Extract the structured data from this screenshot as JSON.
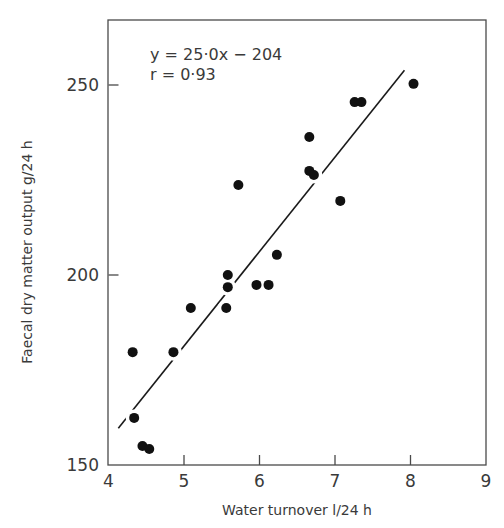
{
  "chart_data": {
    "type": "scatter",
    "title": "",
    "xlabel": "Water turnover  l/24 h",
    "ylabel": "Faecal  dry matter output g/24 h",
    "xlim": [
      4,
      9
    ],
    "ylim": [
      150,
      270
    ],
    "x_ticks": [
      4,
      5,
      6,
      7,
      8,
      9
    ],
    "y_ticks": [
      150,
      200,
      250
    ],
    "grid": false,
    "legend": null,
    "annotations": [
      "y = 25·0x − 204",
      "r = 0·93"
    ],
    "series": [
      {
        "name": "observations",
        "marker": "filled-circle",
        "points": [
          {
            "x": 4.32,
            "y": 179.7
          },
          {
            "x": 4.34,
            "y": 162.4
          },
          {
            "x": 4.45,
            "y": 155.0
          },
          {
            "x": 4.54,
            "y": 154.2
          },
          {
            "x": 4.86,
            "y": 179.7
          },
          {
            "x": 5.09,
            "y": 191.3
          },
          {
            "x": 5.56,
            "y": 191.3
          },
          {
            "x": 5.58,
            "y": 196.8
          },
          {
            "x": 5.58,
            "y": 200.0
          },
          {
            "x": 5.72,
            "y": 223.7
          },
          {
            "x": 5.96,
            "y": 197.4
          },
          {
            "x": 6.12,
            "y": 197.4
          },
          {
            "x": 6.23,
            "y": 205.3
          },
          {
            "x": 6.66,
            "y": 236.3
          },
          {
            "x": 6.66,
            "y": 227.4
          },
          {
            "x": 6.72,
            "y": 226.3
          },
          {
            "x": 7.07,
            "y": 219.5
          },
          {
            "x": 7.26,
            "y": 245.5
          },
          {
            "x": 7.35,
            "y": 245.5
          },
          {
            "x": 8.04,
            "y": 250.3
          }
        ]
      }
    ],
    "regression_line": {
      "label": "y = 25·0x − 204",
      "r": 0.93,
      "drawn_from": {
        "x": 4.13,
        "y": 159.7
      },
      "drawn_to": {
        "x": 7.92,
        "y": 253.9
      }
    }
  },
  "axes": {
    "x_tick_labels": [
      "4",
      "5",
      "6",
      "7",
      "8",
      "9"
    ],
    "y_tick_labels": [
      "150",
      "200",
      "250"
    ],
    "xlabel": "Water turnover  l/24 h",
    "ylabel": "Faecal  dry matter output g/24 h"
  },
  "annotation": {
    "equation": "y = 25·0x − 204",
    "correlation": "r = 0·93"
  },
  "colors": {
    "ink": "#111111",
    "axis": "#4a4a4a",
    "text": "#3a3a3a",
    "background": "#ffffff"
  }
}
